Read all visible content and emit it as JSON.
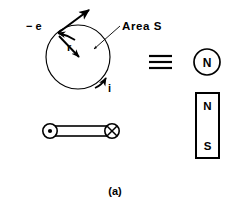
{
  "figure": {
    "caption": "(a)"
  },
  "orbit": {
    "area_label": "Area S",
    "charge_label": "− e",
    "radius_label": "r",
    "current_label": "i",
    "center_x": 78,
    "center_y": 57,
    "radius_px": 32
  },
  "loop_edge_view": {
    "current_out_symbol": "⊙",
    "current_in_symbol": "⊗"
  },
  "equivalence": {
    "symbol": "≡"
  },
  "pole_face": {
    "label": "N"
  },
  "bar_magnet": {
    "north_label": "N",
    "south_label": "S"
  },
  "colors": {
    "ink": "#000000",
    "background": "#ffffff"
  }
}
